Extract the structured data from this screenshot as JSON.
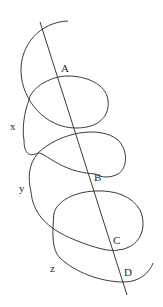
{
  "diagram": {
    "type": "helix-with-axis",
    "stroke_color": "#3a3a3a",
    "background": "#ffffff",
    "axis_line": {
      "x1": 40,
      "y1": 22,
      "x2": 127,
      "y2": 295
    },
    "points": [
      {
        "label": "A",
        "x": 61,
        "y": 72
      },
      {
        "label": "B",
        "x": 94,
        "y": 181
      },
      {
        "label": "C",
        "x": 113,
        "y": 244
      },
      {
        "label": "D",
        "x": 124,
        "y": 276
      }
    ],
    "turn_labels": [
      {
        "label": "x",
        "x": 10,
        "y": 130
      },
      {
        "label": "y",
        "x": 19,
        "y": 192
      },
      {
        "label": "z",
        "x": 50,
        "y": 272
      }
    ]
  }
}
